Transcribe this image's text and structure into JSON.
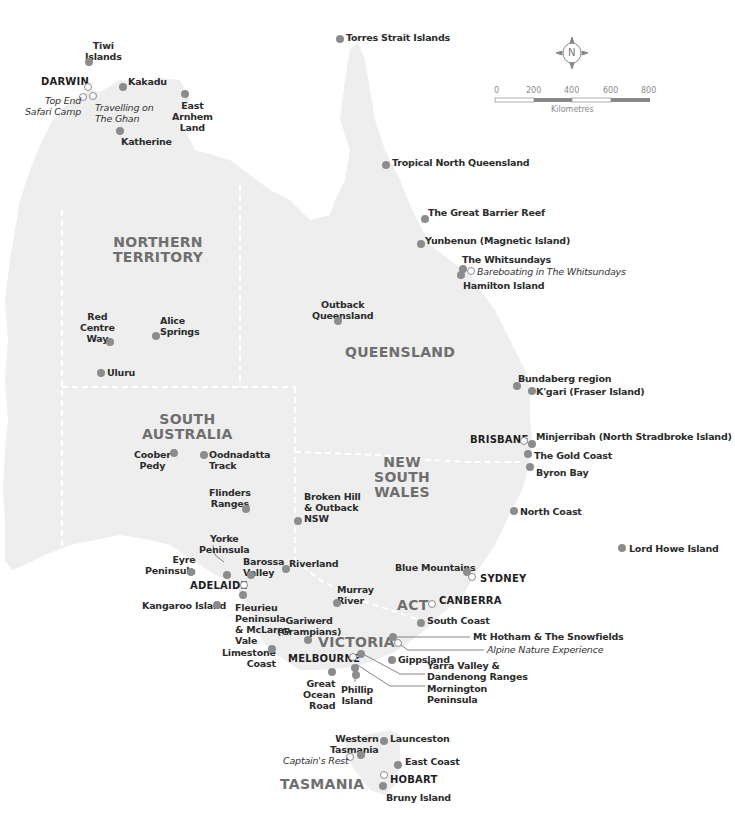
{
  "map": {
    "land_color": "#eeeeee",
    "border_color": "#ffffff",
    "marker_color": "#8c8c8c",
    "state_label_color": "#6f6f6f"
  },
  "compass": {
    "label": "N"
  },
  "scale": {
    "ticks": [
      "0",
      "200",
      "400",
      "600",
      "800"
    ],
    "unit": "Kilometres"
  },
  "states": {
    "nt": "NORTHERN\nTERRITORY",
    "qld": "QUEENSLAND",
    "sa": "SOUTH\nAUSTRALIA",
    "nsw": "NEW\nSOUTH\nWALES",
    "act": "ACT",
    "vic": "VICTORIA",
    "tas": "TASMANIA"
  },
  "cities": {
    "darwin": "DARWIN",
    "brisbane": "BRISBANE",
    "sydney": "SYDNEY",
    "canberra": "CANBERRA",
    "adelaide": "ADELAIDE",
    "melbourne": "MELBOURNE",
    "hobart": "HOBART"
  },
  "experiences": {
    "top_end": "Top End\nSafari Camp",
    "ghan": "Travelling on\nThe Ghan",
    "bareboating": "Bareboating in The Whitsundays",
    "alpine": "Alpine Nature Experience",
    "captains_rest": "Captain's Rest"
  },
  "destinations": {
    "tiwi": "Tiwi\nIslands",
    "kakadu": "Kakadu",
    "east_arnhem": "East\nArnhem\nLand",
    "katherine": "Katherine",
    "torres": "Torres Strait Islands",
    "tropical_nq": "Tropical North Queensland",
    "gbr": "The Great Barrier Reef",
    "yunbenun": "Yunbenun (Magnetic Island)",
    "whitsundays": "The Whitsundays",
    "hamilton": "Hamilton Island",
    "red_centre": "Red\nCentre\nWay",
    "alice": "Alice\nSprings",
    "uluru": "Uluru",
    "outback_qld": "Outback\nQueensland",
    "bundaberg": "Bundaberg region",
    "kgari": "K'gari (Fraser Island)",
    "minjerribah": "Minjerribah (North Stradbroke Island)",
    "gold_coast": "The Gold Coast",
    "byron": "Byron Bay",
    "north_coast": "North Coast",
    "lord_howe": "Lord Howe Island",
    "coober_pedy": "Coober\nPedy",
    "oodnadatta": "Oodnadatta\nTrack",
    "flinders": "Flinders\nRanges",
    "broken_hill": "Broken Hill\n& Outback\nNSW",
    "yorke": "Yorke\nPeninsula",
    "eyre": "Eyre\nPeninsula",
    "barossa": "Barossa\nValley",
    "riverland": "Riverland",
    "blue_mountains": "Blue Mountains",
    "kangaroo_island": "Kangaroo Island",
    "fleurieu": "Fleurieu\nPeninsula\n& McLaren\nVale",
    "murray": "Murray\nRiver",
    "south_coast": "South Coast",
    "grampians": "Gariwerd\n(Grampians)",
    "mt_hotham": "Mt Hotham & The Snowfields",
    "limestone": "Limestone\nCoast",
    "gippsland": "Gippsland",
    "yarra": "Yarra Valley &\nDandenong Ranges",
    "great_ocean": "Great\nOcean\nRoad",
    "phillip": "Phillip\nIsland",
    "mornington": "Mornington\nPeninsula",
    "western_tas": "Western\nTasmania",
    "launceston": "Launceston",
    "east_coast": "East Coast",
    "bruny": "Bruny Island"
  }
}
